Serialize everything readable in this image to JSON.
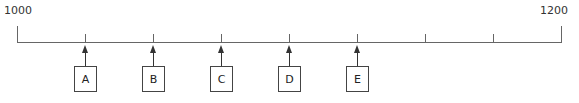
{
  "timeline": {
    "start_label": "1000",
    "end_label": "1200",
    "start_value": 1000,
    "end_value": 1200,
    "intermediate_ticks": 7,
    "markers": [
      {
        "label": "A"
      },
      {
        "label": "B"
      },
      {
        "label": "C"
      },
      {
        "label": "D"
      },
      {
        "label": "E"
      }
    ]
  }
}
